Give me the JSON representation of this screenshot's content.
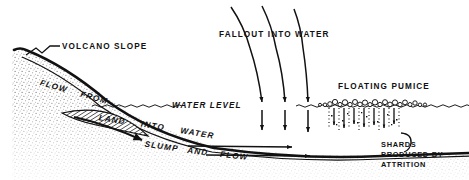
{
  "figure": {
    "type": "geological-cross-section",
    "background_color": "#ffffff",
    "ink_color": "#111111"
  },
  "labels": {
    "volcano_slope": "VOLCANO SLOPE",
    "flow_from": "FLOW FROM",
    "land_into_water": "LAND INTO WATER",
    "slump_and_flow": "SLUMP AND FLOW",
    "water_level": "WATER LEVEL",
    "fallout_into_water": "FALLOUT INTO WATER",
    "floating_pumice": "FLOATING PUMICE",
    "shards_line1": "SHARDS",
    "shards_line2": "PRODUCED BY",
    "shards_line3": "ATTRITION"
  },
  "label_pieces": {
    "flow": "FLOW",
    "from": "FROM",
    "land": "LAND",
    "into": "INTO",
    "water": "WATER",
    "slump": "SLUMP",
    "and": "AND",
    "flow2": "FLOW"
  },
  "features": {
    "stipple_region": "volcanic-edifice-stipple",
    "hatched_deposit": "slump-deposit-hatched-lens",
    "pumice_count": 22,
    "fallout_arrow_count": 3,
    "shard_trail_count": 7,
    "seafloor_arrow_count": 2
  },
  "colors": {
    "ink": "#111111",
    "stipple": "#8a8a8a",
    "background": "#ffffff"
  }
}
